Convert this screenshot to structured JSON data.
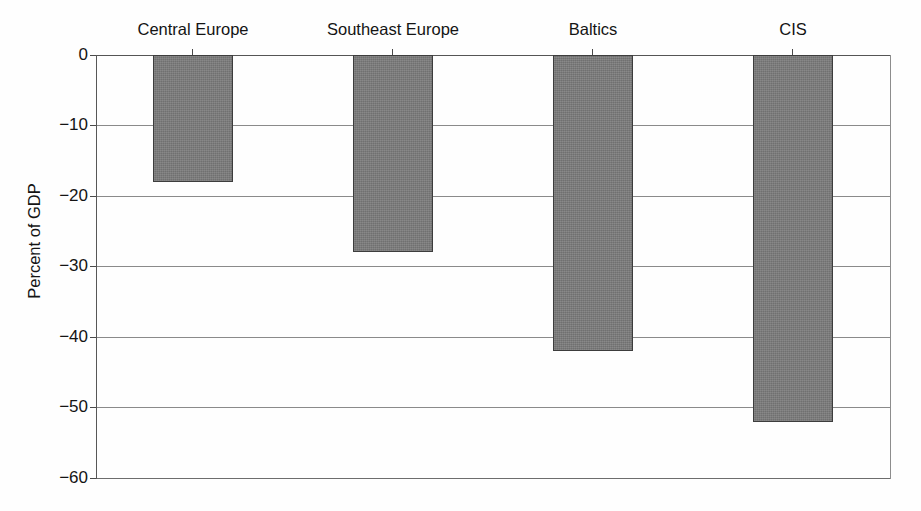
{
  "chart_data": {
    "type": "bar",
    "title": "",
    "subtitle": "",
    "xlabel": "",
    "ylabel": "Percent of GDP",
    "categories": [
      "Central Europe",
      "Southeast Europe",
      "Baltics",
      "CIS"
    ],
    "values": [
      -18,
      -28,
      -42,
      -52
    ],
    "series": [
      {
        "name": "Percent of GDP",
        "values": [
          -18,
          -28,
          -42,
          -52
        ]
      }
    ],
    "ylim": [
      -60,
      0
    ],
    "ytick_labels": [
      "0",
      "−10",
      "−20",
      "−30",
      "−40",
      "−50",
      "−60"
    ],
    "ytick_values": [
      0,
      -10,
      -20,
      -30,
      -40,
      -50,
      -60
    ],
    "grid": "horizontal",
    "legend": "none",
    "bar_color": "#7b7b7b",
    "bar_edge_color": "#3d3d3d",
    "grid_color": "#8a8a8a",
    "axis_color": "#575757",
    "text_color": "#141414",
    "background": "#ffffff",
    "annotations": []
  }
}
